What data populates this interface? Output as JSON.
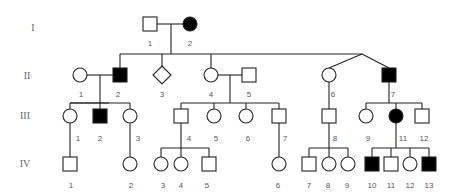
{
  "generations": [
    {
      "label": "I",
      "x": 33,
      "y": 31
    },
    {
      "label": "II",
      "x": 27,
      "y": 79
    },
    {
      "label": "III",
      "x": 25,
      "y": 119
    },
    {
      "label": "IV",
      "x": 25,
      "y": 167
    }
  ],
  "individuals": [
    {
      "id": "I-1",
      "label": "1",
      "sex": "male",
      "affected": false,
      "x": 150,
      "y": 24,
      "lx": 150,
      "ly": 46
    },
    {
      "id": "I-2",
      "label": "2",
      "sex": "female",
      "affected": true,
      "x": 190,
      "y": 24,
      "lx": 190,
      "ly": 46
    },
    {
      "id": "II-1",
      "label": "1",
      "sex": "female",
      "affected": false,
      "x": 80,
      "y": 75,
      "lx": 81,
      "ly": 97
    },
    {
      "id": "II-2",
      "label": "2",
      "sex": "male",
      "affected": true,
      "x": 120,
      "y": 75,
      "lx": 118,
      "ly": 97
    },
    {
      "id": "II-3",
      "label": "3",
      "sex": "unknown",
      "affected": false,
      "x": 162,
      "y": 75,
      "lx": 162,
      "ly": 97
    },
    {
      "id": "II-4",
      "label": "4",
      "sex": "female",
      "affected": false,
      "x": 211,
      "y": 75,
      "lx": 211,
      "ly": 97
    },
    {
      "id": "II-5",
      "label": "5",
      "sex": "male",
      "affected": false,
      "x": 249,
      "y": 75,
      "lx": 249,
      "ly": 97
    },
    {
      "id": "II-6",
      "label": "6",
      "sex": "female",
      "affected": false,
      "x": 329,
      "y": 75,
      "lx": 333,
      "ly": 97
    },
    {
      "id": "II-7",
      "label": "7",
      "sex": "male",
      "affected": true,
      "x": 389,
      "y": 75,
      "lx": 393,
      "ly": 97
    },
    {
      "id": "III-1",
      "label": "1",
      "sex": "female",
      "affected": false,
      "x": 70,
      "y": 116,
      "lx": 78,
      "ly": 141
    },
    {
      "id": "III-2",
      "label": "2",
      "sex": "male",
      "affected": true,
      "x": 100,
      "y": 116,
      "lx": 100,
      "ly": 141
    },
    {
      "id": "III-3",
      "label": "3",
      "sex": "female",
      "affected": false,
      "x": 130,
      "y": 116,
      "lx": 138,
      "ly": 141
    },
    {
      "id": "III-4",
      "label": "4",
      "sex": "male",
      "affected": false,
      "x": 181,
      "y": 116,
      "lx": 189,
      "ly": 141
    },
    {
      "id": "III-5",
      "label": "5",
      "sex": "female",
      "affected": false,
      "x": 214,
      "y": 116,
      "lx": 216,
      "ly": 141
    },
    {
      "id": "III-6",
      "label": "6",
      "sex": "female",
      "affected": false,
      "x": 246,
      "y": 116,
      "lx": 248,
      "ly": 141
    },
    {
      "id": "III-7",
      "label": "7",
      "sex": "male",
      "affected": false,
      "x": 279,
      "y": 116,
      "lx": 285,
      "ly": 141
    },
    {
      "id": "III-8",
      "label": "8",
      "sex": "male",
      "affected": false,
      "x": 329,
      "y": 116,
      "lx": 335,
      "ly": 141
    },
    {
      "id": "III-9",
      "label": "9",
      "sex": "female",
      "affected": false,
      "x": 366,
      "y": 116,
      "lx": 368,
      "ly": 141
    },
    {
      "id": "III-10",
      "label": "11",
      "sex": "female",
      "affected": true,
      "x": 396,
      "y": 116,
      "lx": 403,
      "ly": 141
    },
    {
      "id": "III-11",
      "label": "12",
      "sex": "male",
      "affected": false,
      "x": 422,
      "y": 116,
      "lx": 424,
      "ly": 141
    },
    {
      "id": "IV-1",
      "label": "1",
      "sex": "male",
      "affected": false,
      "x": 70,
      "y": 164,
      "lx": 71,
      "ly": 188
    },
    {
      "id": "IV-2",
      "label": "2",
      "sex": "female",
      "affected": false,
      "x": 130,
      "y": 164,
      "lx": 131,
      "ly": 188
    },
    {
      "id": "IV-3",
      "label": "3",
      "sex": "female",
      "affected": false,
      "x": 161,
      "y": 164,
      "lx": 163,
      "ly": 188
    },
    {
      "id": "IV-4",
      "label": "4",
      "sex": "female",
      "affected": false,
      "x": 181,
      "y": 164,
      "lx": 181,
      "ly": 188
    },
    {
      "id": "IV-5",
      "label": "5",
      "sex": "male",
      "affected": false,
      "x": 209,
      "y": 164,
      "lx": 207,
      "ly": 188
    },
    {
      "id": "IV-6",
      "label": "6",
      "sex": "female",
      "affected": false,
      "x": 279,
      "y": 164,
      "lx": 278,
      "ly": 188
    },
    {
      "id": "IV-7",
      "label": "7",
      "sex": "male",
      "affected": false,
      "x": 309,
      "y": 164,
      "lx": 309,
      "ly": 188
    },
    {
      "id": "IV-8",
      "label": "8",
      "sex": "female",
      "affected": false,
      "x": 329,
      "y": 164,
      "lx": 328,
      "ly": 188
    },
    {
      "id": "IV-9",
      "label": "9",
      "sex": "female",
      "affected": false,
      "x": 348,
      "y": 164,
      "lx": 347,
      "ly": 188
    },
    {
      "id": "IV-10",
      "label": "10",
      "sex": "male",
      "affected": true,
      "x": 372,
      "y": 164,
      "lx": 372,
      "ly": 188
    },
    {
      "id": "IV-11",
      "label": "11",
      "sex": "male",
      "affected": false,
      "x": 391,
      "y": 164,
      "lx": 391,
      "ly": 188
    },
    {
      "id": "IV-12",
      "label": "12",
      "sex": "female",
      "affected": false,
      "x": 410,
      "y": 164,
      "lx": 410,
      "ly": 188
    },
    {
      "id": "IV-13",
      "label": "13",
      "sex": "male",
      "affected": true,
      "x": 429,
      "y": 164,
      "lx": 429,
      "ly": 188
    }
  ],
  "lines": [
    [
      157,
      24,
      184,
      24
    ],
    [
      171,
      24,
      171,
      54
    ],
    [
      120,
      54,
      362,
      54
    ],
    [
      120,
      54,
      120,
      68
    ],
    [
      162,
      54,
      162,
      67
    ],
    [
      211,
      54,
      211,
      68
    ],
    [
      362,
      54,
      329,
      68
    ],
    [
      362,
      54,
      389,
      68
    ],
    [
      87,
      75,
      113,
      75
    ],
    [
      100,
      75,
      100,
      103
    ],
    [
      70,
      103,
      130,
      103
    ],
    [
      70,
      103,
      109,
      103
    ],
    [
      70,
      103,
      70,
      109
    ],
    [
      100,
      103,
      100,
      109
    ],
    [
      130,
      103,
      130,
      109
    ],
    [
      218,
      75,
      242,
      75
    ],
    [
      230,
      75,
      230,
      103
    ],
    [
      181,
      103,
      279,
      103
    ],
    [
      181,
      103,
      181,
      109
    ],
    [
      214,
      103,
      214,
      109
    ],
    [
      246,
      103,
      246,
      109
    ],
    [
      279,
      103,
      279,
      109
    ],
    [
      329,
      82,
      329,
      109
    ],
    [
      389,
      82,
      389,
      103
    ],
    [
      366,
      103,
      422,
      103
    ],
    [
      366,
      103,
      366,
      109
    ],
    [
      396,
      103,
      396,
      109
    ],
    [
      422,
      103,
      422,
      109
    ],
    [
      70,
      123,
      70,
      157
    ],
    [
      130,
      123,
      130,
      157
    ],
    [
      181,
      123,
      181,
      148
    ],
    [
      161,
      148,
      209,
      148
    ],
    [
      161,
      148,
      161,
      157
    ],
    [
      181,
      148,
      181,
      157
    ],
    [
      209,
      148,
      209,
      157
    ],
    [
      279,
      123,
      279,
      157
    ],
    [
      329,
      123,
      329,
      148
    ],
    [
      309,
      148,
      348,
      148
    ],
    [
      309,
      148,
      309,
      157
    ],
    [
      329,
      148,
      329,
      157
    ],
    [
      348,
      148,
      348,
      157
    ],
    [
      396,
      123,
      396,
      148
    ],
    [
      372,
      148,
      429,
      148
    ],
    [
      372,
      148,
      372,
      157
    ],
    [
      391,
      148,
      391,
      157
    ],
    [
      410,
      148,
      410,
      157
    ],
    [
      429,
      148,
      429,
      157
    ]
  ],
  "colors": {
    "stroke": "#222222",
    "affected_fill": "#000000",
    "unaffected_fill": "#ffffff",
    "label": "#555555"
  }
}
